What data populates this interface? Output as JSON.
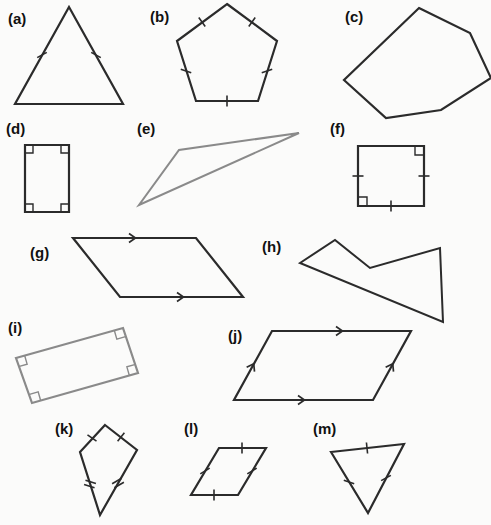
{
  "page": {
    "background_color": "#fbfbfa",
    "width": 491,
    "height": 525,
    "stroke_dark": "#2b2b2b",
    "stroke_gray": "#8a8a8a",
    "mark_color": "#2b2b2b"
  },
  "figures": [
    {
      "key": "a",
      "label": "(a)",
      "name": "isosceles-triangle",
      "label_pos": [
        8,
        24
      ],
      "color": "#2b2b2b",
      "stroke_width": 2.2,
      "points": "69,7 123,104 15,104",
      "closed": true,
      "tick_marks": [
        {
          "x": 42,
          "y": 55,
          "angle": 61,
          "count": 1
        },
        {
          "x": 96,
          "y": 55,
          "angle": -61,
          "count": 1
        }
      ],
      "right_angles": [],
      "arrows": []
    },
    {
      "key": "b",
      "label": "(b)",
      "name": "regular-pentagon",
      "label_pos": [
        150,
        22
      ],
      "color": "#2b2b2b",
      "stroke_width": 2.2,
      "points": "227,4 277,41 258,101 196,101 177,41",
      "closed": true,
      "tick_marks": [
        {
          "x": 252,
          "y": 22,
          "angle": 36,
          "count": 1
        },
        {
          "x": 267,
          "y": 71,
          "angle": 72,
          "count": 1
        },
        {
          "x": 227,
          "y": 101,
          "angle": 0,
          "count": 1
        },
        {
          "x": 186,
          "y": 71,
          "angle": -72,
          "count": 1
        },
        {
          "x": 202,
          "y": 22,
          "angle": -36,
          "count": 1
        }
      ],
      "right_angles": [],
      "arrows": []
    },
    {
      "key": "c",
      "label": "(c)",
      "name": "irregular-hexagon",
      "label_pos": [
        345,
        22
      ],
      "color": "#2b2b2b",
      "stroke_width": 2.2,
      "points": "419,8 470,33 491,78 441,110 386,118 344,80",
      "closed": true,
      "tick_marks": [],
      "right_angles": [],
      "arrows": []
    },
    {
      "key": "d",
      "label": "(d)",
      "name": "rectangle-right-angles",
      "label_pos": [
        6,
        134
      ],
      "color": "#2b2b2b",
      "stroke_width": 2.2,
      "points": "25,145 69,145 69,212 25,212",
      "closed": true,
      "tick_marks": [],
      "right_angles": [
        {
          "x": 25,
          "y": 145,
          "dx": 1,
          "dy": 1,
          "size": 8
        },
        {
          "x": 69,
          "y": 145,
          "dx": -1,
          "dy": 1,
          "size": 8
        },
        {
          "x": 69,
          "y": 212,
          "dx": -1,
          "dy": -1,
          "size": 8
        },
        {
          "x": 25,
          "y": 212,
          "dx": 1,
          "dy": -1,
          "size": 8
        }
      ],
      "arrows": []
    },
    {
      "key": "e",
      "label": "(e)",
      "name": "scalene-thin-triangle",
      "label_pos": [
        137,
        134
      ],
      "color": "#8a8a8a",
      "stroke_width": 2.0,
      "points": "299,133 179,150 139,205",
      "closed": true,
      "tick_marks": [],
      "right_angles": [],
      "arrows": []
    },
    {
      "key": "f",
      "label": "(f)",
      "name": "square-right-angles-ticks",
      "label_pos": [
        330,
        134
      ],
      "color": "#2b2b2b",
      "stroke_width": 2.2,
      "points": "358,146 424,146 424,206 358,206",
      "closed": true,
      "tick_marks": [
        {
          "x": 358,
          "y": 176,
          "angle": 90,
          "count": 1
        },
        {
          "x": 424,
          "y": 176,
          "angle": 90,
          "count": 1
        },
        {
          "x": 391,
          "y": 206,
          "angle": 0,
          "count": 1
        }
      ],
      "right_angles": [
        {
          "x": 424,
          "y": 146,
          "dx": -1,
          "dy": 1,
          "size": 9
        },
        {
          "x": 358,
          "y": 206,
          "dx": 1,
          "dy": -1,
          "size": 9
        }
      ],
      "arrows": []
    },
    {
      "key": "g",
      "label": "(g)",
      "name": "parallelogram-single-arrows",
      "label_pos": [
        30,
        258
      ],
      "color": "#2b2b2b",
      "stroke_width": 2.2,
      "points": "73,238 196,238 243,297 120,297",
      "closed": true,
      "tick_marks": [],
      "right_angles": [],
      "arrows": [
        {
          "x": 134,
          "y": 238,
          "angle": 0,
          "count": 1
        },
        {
          "x": 182,
          "y": 297,
          "angle": 0,
          "count": 1
        }
      ]
    },
    {
      "key": "h",
      "label": "(h)",
      "name": "concave-pentagon",
      "label_pos": [
        262,
        252
      ],
      "color": "#2b2b2b",
      "stroke_width": 2.0,
      "points": "300,263 335,240 370,268 440,248 443,322",
      "closed": true,
      "tick_marks": [],
      "right_angles": [],
      "arrows": []
    },
    {
      "key": "i",
      "label": "(i)",
      "name": "tilted-rectangle-right-angles",
      "label_pos": [
        8,
        333
      ],
      "color": "#8a8a8a",
      "stroke_width": 2.2,
      "points": "16,358 123,328 138,373 32,403",
      "closed": true,
      "tick_marks": [],
      "right_angles": [
        {
          "x": 16,
          "y": 358,
          "dx": 1,
          "dy": 1,
          "size": 9,
          "rot": -16
        },
        {
          "x": 123,
          "y": 328,
          "dx": -1,
          "dy": 1,
          "size": 9,
          "rot": -16
        },
        {
          "x": 138,
          "y": 373,
          "dx": -1,
          "dy": -1,
          "size": 9,
          "rot": -16
        },
        {
          "x": 32,
          "y": 403,
          "dx": 1,
          "dy": -1,
          "size": 9,
          "rot": -16
        }
      ],
      "arrows": []
    },
    {
      "key": "j",
      "label": "(j)",
      "name": "parallelogram-all-arrows",
      "label_pos": [
        228,
        341
      ],
      "color": "#2b2b2b",
      "stroke_width": 2.2,
      "points": "272,331 411,331 373,400 234,400",
      "closed": true,
      "tick_marks": [],
      "right_angles": [],
      "arrows": [
        {
          "x": 341,
          "y": 331,
          "angle": 0,
          "count": 1
        },
        {
          "x": 303,
          "y": 400,
          "angle": 0,
          "count": 1
        },
        {
          "x": 253,
          "y": 365,
          "angle": -61,
          "count": 1
        },
        {
          "x": 392,
          "y": 365,
          "angle": -61,
          "count": 1
        }
      ]
    },
    {
      "key": "k",
      "label": "(k)",
      "name": "kite",
      "label_pos": [
        55,
        434
      ],
      "color": "#2b2b2b",
      "stroke_width": 2.2,
      "points": "105,425 137,450 100,515 80,452",
      "closed": true,
      "tick_marks": [
        {
          "x": 121,
          "y": 437,
          "angle": 38,
          "count": 1
        },
        {
          "x": 92,
          "y": 438,
          "angle": -55,
          "count": 1
        },
        {
          "x": 118,
          "y": 483,
          "angle": 60,
          "count": 2
        },
        {
          "x": 90,
          "y": 484,
          "angle": -72,
          "count": 2
        }
      ],
      "right_angles": [],
      "arrows": []
    },
    {
      "key": "l",
      "label": "(l)",
      "name": "rhombus",
      "label_pos": [
        184,
        434
      ],
      "color": "#2b2b2b",
      "stroke_width": 2.2,
      "points": "219,448 266,448 238,495 191,495",
      "closed": true,
      "tick_marks": [
        {
          "x": 242,
          "y": 448,
          "angle": 0,
          "count": 1
        },
        {
          "x": 252,
          "y": 471,
          "angle": 59,
          "count": 1
        },
        {
          "x": 214,
          "y": 495,
          "angle": 0,
          "count": 1
        },
        {
          "x": 205,
          "y": 471,
          "angle": 59,
          "count": 1
        }
      ],
      "right_angles": [],
      "arrows": []
    },
    {
      "key": "m",
      "label": "(m)",
      "name": "equilateral-triangle",
      "label_pos": [
        313,
        434
      ],
      "color": "#2b2b2b",
      "stroke_width": 2.2,
      "points": "331,452 404,444 368,513",
      "closed": true,
      "tick_marks": [
        {
          "x": 367,
          "y": 448,
          "angle": -6,
          "count": 1
        },
        {
          "x": 386,
          "y": 478,
          "angle": 62,
          "count": 1
        },
        {
          "x": 349,
          "y": 482,
          "angle": -71,
          "count": 1
        }
      ],
      "right_angles": [],
      "arrows": []
    }
  ]
}
